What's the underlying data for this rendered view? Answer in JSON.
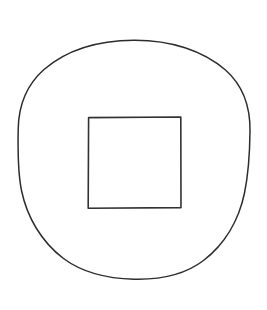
{
  "page": {
    "background_color": "#ffffff",
    "width": 267,
    "height": 310
  },
  "drawing": {
    "style": {
      "stroke_color": "#2e2d2e",
      "stroke_width": 1.5,
      "fill": "none",
      "line_quality": "hand-drawn"
    },
    "shapes": [
      {
        "name": "outer-circle",
        "type": "ellipse",
        "label": "Circle",
        "center_x": 134,
        "center_y": 159.5,
        "radius_x": 116,
        "radius_y": 119.5,
        "bounds": {
          "left": 18,
          "top": 40,
          "right": 250,
          "bottom": 279
        },
        "stroke_color": "#2e2d2e",
        "stroke_width": 1.5
      },
      {
        "name": "inner-square",
        "type": "rect",
        "label": "Square",
        "x": 88,
        "y": 117,
        "width": 93,
        "height": 91,
        "bounds": {
          "left": 88,
          "top": 117,
          "right": 181,
          "bottom": 208
        },
        "stroke_color": "#333133",
        "stroke_width": 1.6
      }
    ]
  }
}
